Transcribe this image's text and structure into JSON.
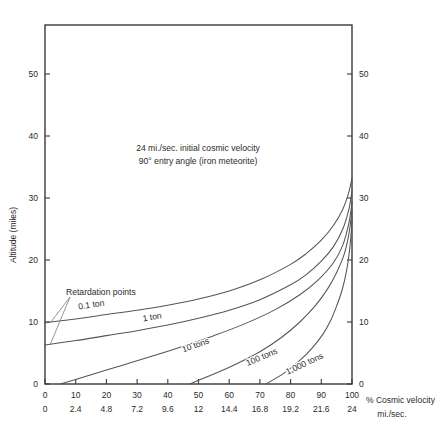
{
  "chart_data": {
    "type": "line",
    "title": "24 mi./sec. initial cosmic velocity",
    "subtitle": "90° entry angle (iron meteorite)",
    "xlabel": "% Cosmic velocity",
    "xlabel_secondary": "mi./sec.",
    "ylabel": "Altitude (miles)",
    "xlim": [
      0,
      100
    ],
    "ylim": [
      0,
      58
    ],
    "grid": false,
    "legend": "inline-curve-labels",
    "x_ticks_percent": [
      "0",
      "10",
      "20",
      "30",
      "40",
      "50",
      "60",
      "70",
      "80",
      "90",
      "100"
    ],
    "x_ticks_mips": [
      "0",
      "2.4",
      "4.8",
      "7.2",
      "9.6",
      "12",
      "14.4",
      "16.8",
      "19.2",
      "21.6",
      "24"
    ],
    "y_ticks_left": [
      "0",
      "10",
      "20",
      "30",
      "40",
      "50"
    ],
    "y_ticks_right": [
      "0",
      "10",
      "20",
      "30",
      "40",
      "50"
    ],
    "annotations": [
      {
        "text": "Retardation points",
        "x_percent": 5,
        "y_miles": 15.5
      }
    ],
    "series": [
      {
        "name": "0.1 ton",
        "label": "0.1 ton",
        "points": [
          [
            0,
            9.9
          ],
          [
            10,
            10.5
          ],
          [
            20,
            11.2
          ],
          [
            30,
            11.9
          ],
          [
            40,
            12.7
          ],
          [
            50,
            13.7
          ],
          [
            60,
            15.0
          ],
          [
            70,
            16.8
          ],
          [
            80,
            19.3
          ],
          [
            85,
            21.0
          ],
          [
            90,
            23.2
          ],
          [
            94,
            25.6
          ],
          [
            97,
            28.2
          ],
          [
            99,
            31.0
          ],
          [
            100,
            33.2
          ]
        ]
      },
      {
        "name": "1 ton",
        "label": "1 ton",
        "points": [
          [
            0,
            6.3
          ],
          [
            10,
            7.0
          ],
          [
            20,
            7.8
          ],
          [
            30,
            8.6
          ],
          [
            40,
            9.5
          ],
          [
            50,
            10.6
          ],
          [
            60,
            11.9
          ],
          [
            70,
            13.6
          ],
          [
            80,
            16.0
          ],
          [
            85,
            17.6
          ],
          [
            90,
            19.8
          ],
          [
            94,
            22.2
          ],
          [
            97,
            25.0
          ],
          [
            99,
            28.2
          ],
          [
            100,
            31.2
          ]
        ]
      },
      {
        "name": "10 tons",
        "label": "10 tons",
        "points": [
          [
            5,
            0.0
          ],
          [
            15,
            1.5
          ],
          [
            25,
            3.0
          ],
          [
            35,
            4.5
          ],
          [
            45,
            6.1
          ],
          [
            55,
            7.8
          ],
          [
            65,
            9.7
          ],
          [
            75,
            12.0
          ],
          [
            83,
            14.4
          ],
          [
            89,
            16.8
          ],
          [
            94,
            19.6
          ],
          [
            97,
            22.4
          ],
          [
            99,
            26.0
          ],
          [
            100,
            29.3
          ]
        ]
      },
      {
        "name": "100 tons",
        "label": "100 tons",
        "points": [
          [
            47,
            0.0
          ],
          [
            55,
            1.6
          ],
          [
            63,
            3.4
          ],
          [
            70,
            5.2
          ],
          [
            77,
            7.5
          ],
          [
            83,
            10.0
          ],
          [
            88,
            12.6
          ],
          [
            92,
            15.3
          ],
          [
            95,
            18.0
          ],
          [
            97.5,
            21.0
          ],
          [
            99,
            24.2
          ],
          [
            100,
            28.0
          ]
        ]
      },
      {
        "name": "1,000 tons",
        "label": "1,000 tons",
        "points": [
          [
            72,
            0.0
          ],
          [
            78,
            1.8
          ],
          [
            83,
            3.8
          ],
          [
            87,
            5.8
          ],
          [
            90.5,
            8.0
          ],
          [
            93,
            10.2
          ],
          [
            95,
            12.6
          ],
          [
            96.8,
            15.2
          ],
          [
            98.2,
            18.2
          ],
          [
            99.2,
            21.6
          ],
          [
            99.8,
            24.8
          ],
          [
            100,
            27.0
          ]
        ]
      }
    ],
    "series_label_placements": [
      {
        "name": "0.1 ton",
        "x_percent": 11,
        "y_miles": 12.0,
        "rotation": -9
      },
      {
        "name": "1 ton",
        "x_percent": 32,
        "y_miles": 10.1,
        "rotation": -10
      },
      {
        "name": "10 tons",
        "x_percent": 45,
        "y_miles": 5.1,
        "rotation": -19
      },
      {
        "name": "100 tons",
        "x_percent": 66,
        "y_miles": 2.9,
        "rotation": -23
      },
      {
        "name": "1,000 tons",
        "x_percent": 79,
        "y_miles": 1.5,
        "rotation": -25
      }
    ],
    "colors": {
      "curve": "#555555",
      "axis": "#3a3a3a",
      "text": "#2b2b2b",
      "background": "#ffffff"
    }
  }
}
